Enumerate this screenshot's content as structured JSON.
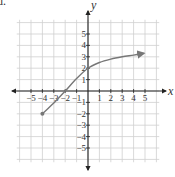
{
  "problem_label": "d.",
  "chart_data": {
    "type": "line",
    "title": "",
    "xlabel": "x",
    "ylabel": "y",
    "xlim": [
      -6,
      6
    ],
    "ylim": [
      -6,
      6
    ],
    "grid": true,
    "x_ticks": [
      -5,
      -4,
      -3,
      -2,
      -1,
      1,
      2,
      3,
      4,
      5
    ],
    "y_ticks": [
      -5,
      -4,
      -3,
      -2,
      -1,
      1,
      2,
      3,
      4,
      5
    ],
    "x_tick_labels": [
      "−5",
      "−4",
      "−3",
      "−2",
      "−1",
      "1",
      "2",
      "3",
      "4",
      "5"
    ],
    "y_tick_labels": [
      "−5",
      "−4",
      "−3",
      "−2",
      "−1",
      "1",
      "2",
      "3",
      "4",
      "5"
    ],
    "series": [
      {
        "name": "f(x)",
        "x": [
          -4,
          -3,
          -2,
          -1,
          0,
          1,
          2,
          3,
          4,
          4.9
        ],
        "y": [
          -2,
          -1.05,
          0,
          1.1,
          2,
          2.5,
          2.8,
          3.0,
          3.15,
          3.3
        ],
        "start_point": {
          "x": -4,
          "y": -2,
          "marker": "closed-dot"
        },
        "end": "arrow",
        "color": "#777777"
      }
    ],
    "colors": {
      "axis": "#222222",
      "grid": "#cfcfcf",
      "curve": "#777777"
    }
  }
}
